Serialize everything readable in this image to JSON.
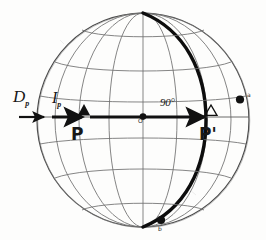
{
  "figure": {
    "kind": "sphere-graticule-diagram",
    "title_visible": false,
    "background_color": "#fdfdfc",
    "ink_color": "#1a1a1a",
    "grid_color": "#6b6b6b"
  },
  "sphere": {
    "center_x": 143,
    "center_y": 120,
    "radius_x": 106,
    "radius_y": 107,
    "outline_color": "#4a4a4a",
    "meridian_count": 7,
    "parallel_count": 5
  },
  "labels": {
    "declination": "D",
    "declination_sub": "p",
    "inclination": "I",
    "inclination_sub": "p",
    "pole_p": "P",
    "pole_p_prime": "P'",
    "angle": "90°",
    "center_marker": "O",
    "right_marker": "a",
    "bottom_marker": "b"
  },
  "markers": {
    "p_triangle": {
      "style": "filled",
      "x": 84,
      "y": 112,
      "color": "#111111"
    },
    "p_prime_triangle": {
      "style": "hollow",
      "x": 211,
      "y": 112,
      "color": "#111111"
    },
    "center_dot": {
      "x": 143,
      "y": 117,
      "r": 3.2,
      "color": "#111111"
    },
    "right_dot": {
      "x": 240,
      "y": 100,
      "r": 4.0,
      "color": "#111111"
    },
    "bottom_dot": {
      "x": 161,
      "y": 220,
      "r": 4.0,
      "color": "#111111"
    }
  },
  "arrows": {
    "declination_arrow": {
      "x1": 19,
      "y1": 117,
      "x2": 45,
      "y2": 117,
      "width": 2.2
    },
    "inclination_arrow": {
      "x1": 52,
      "y1": 117,
      "x2": 83,
      "y2": 117,
      "width": 3.0
    },
    "main_arrow": {
      "x1": 88,
      "y1": 117,
      "x2": 205,
      "y2": 117,
      "width": 3.0
    }
  },
  "great_circle": {
    "description": "thick meridian arc",
    "width": 3.4,
    "color": "#0d0d0d",
    "offset_ratio": 0.62
  },
  "equator_line": {
    "y": 117,
    "color": "#5a5a5a"
  }
}
